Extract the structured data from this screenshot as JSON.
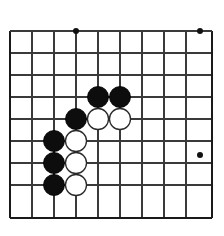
{
  "diagram": {
    "kind": "go-board-diagram",
    "game": "Go",
    "title": "",
    "board_size_visible": {
      "columns": 10,
      "rows": 9
    },
    "colors": {
      "background": "#ffffff",
      "grid_line": "#3a3a3a",
      "board_edge": "#1a1a1a",
      "black_stone": "#0d0d0d",
      "white_stone": "#ffffff",
      "white_stone_outline": "#2a2a2a",
      "star_point": "#111111"
    },
    "geometry": {
      "width": 224,
      "height": 236,
      "spacing": 22,
      "vertical_lines_x": [
        10,
        32,
        54,
        76,
        98,
        120,
        142,
        164,
        186,
        212
      ],
      "horizontal_lines_y": [
        31,
        53,
        75,
        97,
        119,
        141,
        163,
        185,
        218
      ],
      "left_edge_x": 10,
      "right_edge_x": 212,
      "top_edge_y": 31,
      "bottom_edge_y": 218,
      "stone_radius": 10.5,
      "star_point_radius": 3
    },
    "star_points": [
      {
        "x": 76,
        "y": 31
      },
      {
        "x": 200,
        "y": 31
      },
      {
        "x": 200,
        "y": 155
      }
    ],
    "stones": [
      {
        "color": "black",
        "x": 98,
        "y": 97
      },
      {
        "color": "black",
        "x": 120,
        "y": 97
      },
      {
        "color": "black",
        "x": 76,
        "y": 119
      },
      {
        "color": "black",
        "x": 54,
        "y": 141
      },
      {
        "color": "black",
        "x": 54,
        "y": 163
      },
      {
        "color": "black",
        "x": 54,
        "y": 185
      },
      {
        "color": "white",
        "x": 98,
        "y": 119
      },
      {
        "color": "white",
        "x": 120,
        "y": 119
      },
      {
        "color": "white",
        "x": 76,
        "y": 141
      },
      {
        "color": "white",
        "x": 76,
        "y": 163
      },
      {
        "color": "white",
        "x": 76,
        "y": 185
      }
    ],
    "stone_counts": {
      "black": 6,
      "white": 5
    }
  }
}
